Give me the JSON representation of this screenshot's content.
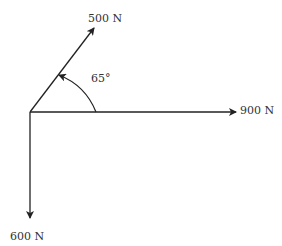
{
  "diagram": {
    "type": "force-vector-diagram",
    "forces": [
      {
        "label": "500 N",
        "direction": "65° above horizontal"
      },
      {
        "label": "900 N",
        "direction": "horizontal right"
      },
      {
        "label": "600 N",
        "direction": "vertical down"
      }
    ],
    "angle_label": "65°"
  }
}
